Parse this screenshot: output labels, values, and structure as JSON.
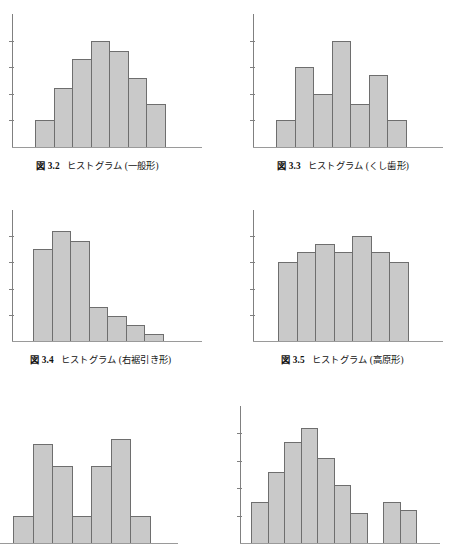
{
  "document": {
    "kind": "textbook-figure-sheet",
    "language": "ja",
    "bar_fill_color": "#c9c9c9",
    "bar_stroke_color": "#6e6e6e",
    "axis_color": "#808080"
  },
  "figures": [
    {
      "id": "fig-3-2",
      "caption_number": "図 3.2",
      "caption_title": "ヒストグラム (一般形)",
      "caption_full": "図 3.2　ヒストグラム (一般形)",
      "shape_name": "一般形"
    },
    {
      "id": "fig-3-3",
      "caption_number": "図 3.3",
      "caption_title": "ヒストグラム (くし歯形)",
      "caption_full": "図 3.3　ヒストグラム (くし歯形)",
      "shape_name": "くし歯形"
    },
    {
      "id": "fig-3-4",
      "caption_number": "図 3.4",
      "caption_title": "ヒストグラム (右裾引き形)",
      "caption_full": "図 3.4　ヒストグラム (右裾引き形)",
      "shape_name": "右裾引き形"
    },
    {
      "id": "fig-3-5",
      "caption_number": "図 3.5",
      "caption_title": "ヒストグラム (高原形)",
      "caption_full": "図 3.5　ヒストグラム (高原形)",
      "shape_name": "高原形"
    },
    {
      "id": "fig-3-6",
      "caption_number": "",
      "caption_title": "",
      "caption_full": "",
      "shape_name": "二山形"
    },
    {
      "id": "fig-3-7",
      "caption_number": "",
      "caption_title": "",
      "caption_full": "",
      "shape_name": "離れ小島形"
    }
  ],
  "chart_data": [
    {
      "type": "bar",
      "title": "図 3.2　ヒストグラム (一般形)",
      "xlabel": "",
      "ylabel": "",
      "grid": false,
      "legend": "none",
      "ylim": [
        0,
        5
      ],
      "axis_ticks_y": [
        1,
        2,
        3,
        4
      ],
      "tick_labels_y": [],
      "categories": [
        "1",
        "2",
        "3",
        "4",
        "5",
        "6",
        "7"
      ],
      "values": [
        1.0,
        2.2,
        3.3,
        4.0,
        3.6,
        2.6,
        1.6
      ]
    },
    {
      "type": "bar",
      "title": "図 3.3　ヒストグラム (くし歯形)",
      "xlabel": "",
      "ylabel": "",
      "grid": false,
      "legend": "none",
      "ylim": [
        0,
        5
      ],
      "axis_ticks_y": [
        1,
        2,
        3,
        4
      ],
      "tick_labels_y": [],
      "categories": [
        "1",
        "2",
        "3",
        "4",
        "5",
        "6",
        "7"
      ],
      "values": [
        1.0,
        3.0,
        2.0,
        4.0,
        1.6,
        2.7,
        1.0
      ]
    },
    {
      "type": "bar",
      "title": "図 3.4　ヒストグラム (右裾引き形)",
      "xlabel": "",
      "ylabel": "",
      "grid": false,
      "legend": "none",
      "ylim": [
        0,
        5
      ],
      "axis_ticks_y": [
        1,
        2,
        3,
        4
      ],
      "tick_labels_y": [],
      "categories": [
        "1",
        "2",
        "3",
        "4",
        "5",
        "6",
        "7"
      ],
      "values": [
        3.5,
        4.2,
        3.8,
        1.3,
        0.95,
        0.6,
        0.25
      ]
    },
    {
      "type": "bar",
      "title": "図 3.5　ヒストグラム (高原形)",
      "xlabel": "",
      "ylabel": "",
      "grid": false,
      "legend": "none",
      "ylim": [
        0,
        5
      ],
      "axis_ticks_y": [
        1,
        2,
        3,
        4
      ],
      "tick_labels_y": [],
      "categories": [
        "1",
        "2",
        "3",
        "4",
        "5",
        "6",
        "7"
      ],
      "values": [
        3.0,
        3.4,
        3.7,
        3.4,
        4.0,
        3.4,
        3.0
      ]
    },
    {
      "type": "bar",
      "title": "",
      "xlabel": "",
      "ylabel": "",
      "grid": false,
      "legend": "none",
      "ylim": [
        0,
        5
      ],
      "axis_ticks_y": [
        1,
        2,
        3,
        4
      ],
      "tick_labels_y": [],
      "categories": [
        "1",
        "2",
        "3",
        "4",
        "5",
        "6",
        "7"
      ],
      "values": [
        1.0,
        3.6,
        2.8,
        1.0,
        2.8,
        3.8,
        1.0
      ]
    },
    {
      "type": "bar",
      "title": "",
      "xlabel": "",
      "ylabel": "",
      "grid": false,
      "legend": "none",
      "ylim": [
        0,
        5
      ],
      "axis_ticks_y": [
        1,
        2,
        3,
        4
      ],
      "tick_labels_y": [],
      "categories": [
        "1",
        "2",
        "3",
        "4",
        "5",
        "6",
        "7",
        "8",
        "9",
        "10"
      ],
      "values": [
        1.5,
        2.6,
        3.7,
        4.2,
        3.1,
        2.1,
        1.1,
        0,
        1.5,
        1.2
      ]
    }
  ]
}
